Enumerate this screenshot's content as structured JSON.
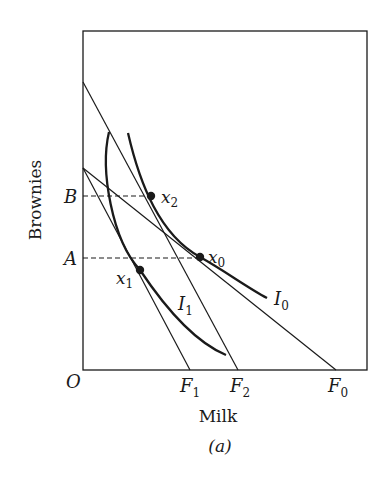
{
  "diagram": {
    "caption": "(a)",
    "x_axis_label": "Milk",
    "y_axis_label": "Brownies",
    "origin_label": "O",
    "y_markers": [
      {
        "label": "B",
        "y": 196
      },
      {
        "label": "A",
        "y": 258
      }
    ],
    "x_intercepts": [
      {
        "label": "F",
        "sub": "1",
        "x": 190
      },
      {
        "label": "F",
        "sub": "2",
        "x": 238
      },
      {
        "label": "F",
        "sub": "0",
        "x": 336
      }
    ],
    "points": [
      {
        "label": "x",
        "sub": "2",
        "x": 151,
        "y": 196
      },
      {
        "label": "x",
        "sub": "0",
        "x": 200,
        "y": 257
      },
      {
        "label": "x",
        "sub": "1",
        "x": 140,
        "y": 270
      }
    ],
    "curves": [
      {
        "label": "I",
        "sub": "0"
      },
      {
        "label": "I",
        "sub": "1"
      }
    ],
    "colors": {
      "ink": "#1a1a1a",
      "background": "#ffffff"
    }
  }
}
